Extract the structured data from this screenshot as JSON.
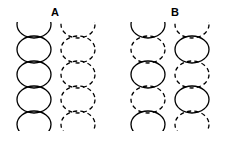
{
  "figure": {
    "background_color": "#ffffff",
    "stroke_color": "#000000",
    "stroke_width": 1.3,
    "dash_pattern": "4.2 3.2",
    "width": 226,
    "height": 141
  },
  "labels": {
    "a": "A",
    "b": "B"
  },
  "geometry": {
    "ellipse_rx": 17,
    "ellipse_ry": 13.5,
    "vertical_pitch": 25,
    "clip_top": 22,
    "clip_bottom": 131,
    "centers_y": [
      24.5,
      49.5,
      74.5,
      99.5,
      124.5
    ]
  },
  "groups": [
    {
      "id": "A",
      "label": "A",
      "label_x": 55,
      "label_y": 12,
      "columns": [
        {
          "id": "A-left",
          "center_x": 34,
          "style_sequence": [
            "solid",
            "solid",
            "solid",
            "solid",
            "solid"
          ],
          "note": "all ellipses solid outline"
        },
        {
          "id": "A-right",
          "center_x": 78,
          "style_sequence": [
            "dashed",
            "dashed",
            "dashed",
            "dashed",
            "dashed"
          ],
          "note": "all ellipses dashed outline"
        }
      ]
    },
    {
      "id": "B",
      "label": "B",
      "label_x": 175,
      "label_y": 12,
      "columns": [
        {
          "id": "B-left",
          "center_x": 148,
          "style_sequence": [
            "solid",
            "dashed",
            "solid",
            "dashed",
            "solid"
          ],
          "note": "alternating starting solid"
        },
        {
          "id": "B-right",
          "center_x": 192,
          "style_sequence": [
            "dashed",
            "solid",
            "dashed",
            "solid",
            "dashed"
          ],
          "note": "alternating starting dashed"
        }
      ]
    }
  ]
}
